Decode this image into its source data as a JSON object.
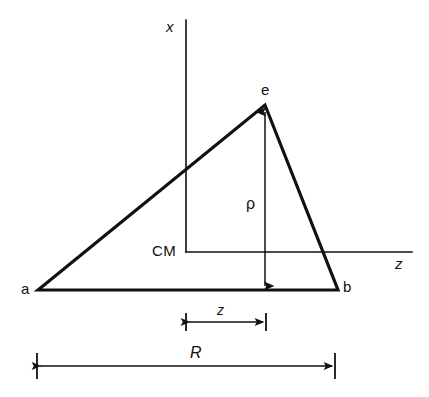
{
  "figure": {
    "caption": "",
    "background_color": "#ffffff",
    "stroke_color": "#111111",
    "width": 429,
    "height": 397
  },
  "axes": {
    "vertical": {
      "label": "x",
      "italic": true,
      "x": 186,
      "y_top": 20,
      "y_bottom": 252
    },
    "horizontal": {
      "label": "z",
      "italic": true,
      "y": 252,
      "x_left": 186,
      "x_right": 412
    },
    "origin": {
      "label": "CM",
      "italic": false,
      "x": 186,
      "y": 252
    }
  },
  "triangle": {
    "vertices": [
      {
        "name": "a",
        "label": "a",
        "x": 38,
        "y": 290
      },
      {
        "name": "b",
        "label": "b",
        "x": 338,
        "y": 290
      },
      {
        "name": "e",
        "label": "e",
        "x": 265,
        "y": 105
      }
    ],
    "stroke_width": 3.2
  },
  "measurements": [
    {
      "name": "rho",
      "label": "ρ",
      "italic": false,
      "orientation": "vertical",
      "x": 265,
      "y_start": 110,
      "y_end": 288,
      "arrowheads": "both"
    },
    {
      "name": "z-offset",
      "label": "z",
      "italic": true,
      "orientation": "horizontal",
      "y": 322,
      "x_start": 186,
      "x_end": 265,
      "arrowheads": "both",
      "tick_extent": 9
    },
    {
      "name": "R-span",
      "label": "R",
      "italic": true,
      "orientation": "horizontal",
      "y": 366,
      "x_start": 37,
      "x_end": 335,
      "arrowheads": "both",
      "tick_extent": 13
    }
  ]
}
